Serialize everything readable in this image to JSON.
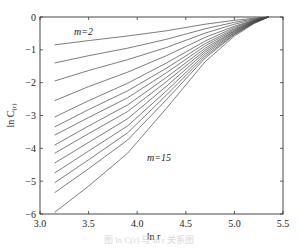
{
  "chart_data": {
    "type": "line",
    "title": "",
    "xlabel": "ln r",
    "ylabel": "ln C(r)",
    "xlim": [
      3.0,
      5.5
    ],
    "ylim": [
      -6,
      0
    ],
    "xticks": [
      "3.0",
      "3.5",
      "4.0",
      "4.5",
      "5.0",
      "5.5"
    ],
    "yticks": [
      "0",
      "-1",
      "-2",
      "-3",
      "-4",
      "-5",
      "-6"
    ],
    "grid": false,
    "legend": "none",
    "annotations": [
      {
        "text": "m=2",
        "x": 3.35,
        "y": -0.55
      },
      {
        "text": "m=15",
        "x": 4.1,
        "y": -4.4
      }
    ],
    "x": [
      3.15,
      3.5,
      3.9,
      4.3,
      4.7,
      5.0,
      5.2,
      5.35
    ],
    "series": [
      {
        "name": "m=2",
        "values": [
          -0.85,
          -0.72,
          -0.58,
          -0.42,
          -0.22,
          -0.1,
          -0.04,
          0.0
        ]
      },
      {
        "name": "m=3",
        "values": [
          -1.4,
          -1.18,
          -0.95,
          -0.68,
          -0.36,
          -0.16,
          -0.06,
          0.0
        ]
      },
      {
        "name": "m=4",
        "values": [
          -1.95,
          -1.63,
          -1.3,
          -0.93,
          -0.49,
          -0.22,
          -0.08,
          0.0
        ]
      },
      {
        "name": "m=5",
        "values": [
          -2.55,
          -2.12,
          -1.68,
          -1.18,
          -0.62,
          -0.28,
          -0.1,
          0.0
        ]
      },
      {
        "name": "m=6",
        "values": [
          -3.05,
          -2.55,
          -2.02,
          -1.4,
          -0.73,
          -0.32,
          -0.11,
          0.0
        ]
      },
      {
        "name": "m=7",
        "values": [
          -3.35,
          -2.82,
          -2.25,
          -1.56,
          -0.81,
          -0.36,
          -0.12,
          0.0
        ]
      },
      {
        "name": "m=8",
        "values": [
          -3.6,
          -3.06,
          -2.46,
          -1.7,
          -0.88,
          -0.39,
          -0.13,
          0.0
        ]
      },
      {
        "name": "m=9",
        "values": [
          -3.9,
          -3.32,
          -2.68,
          -1.84,
          -0.95,
          -0.42,
          -0.14,
          0.0
        ]
      },
      {
        "name": "m=10",
        "values": [
          -4.15,
          -3.55,
          -2.88,
          -1.97,
          -1.01,
          -0.44,
          -0.15,
          0.0
        ]
      },
      {
        "name": "m=11",
        "values": [
          -4.45,
          -3.82,
          -3.1,
          -2.11,
          -1.07,
          -0.47,
          -0.16,
          0.0
        ]
      },
      {
        "name": "m=12",
        "values": [
          -4.75,
          -4.08,
          -3.32,
          -2.25,
          -1.13,
          -0.49,
          -0.17,
          0.0
        ]
      },
      {
        "name": "m=13",
        "values": [
          -5.05,
          -4.35,
          -3.53,
          -2.38,
          -1.19,
          -0.52,
          -0.18,
          0.0
        ]
      },
      {
        "name": "m=14",
        "values": [
          -5.35,
          -4.62,
          -3.75,
          -2.52,
          -1.25,
          -0.54,
          -0.19,
          0.0
        ]
      },
      {
        "name": "m=15",
        "values": [
          -5.95,
          -5.15,
          -4.15,
          -2.78,
          -1.36,
          -0.58,
          -0.2,
          0.0
        ]
      }
    ]
  },
  "labels": {
    "xlabel": "ln r",
    "ylabel_main": "ln C",
    "ylabel_sub": "(r)",
    "annot_top": "m=2",
    "annot_bottom": "m=15",
    "caption": "图 ln C(r) 与 ln r 关系图"
  }
}
